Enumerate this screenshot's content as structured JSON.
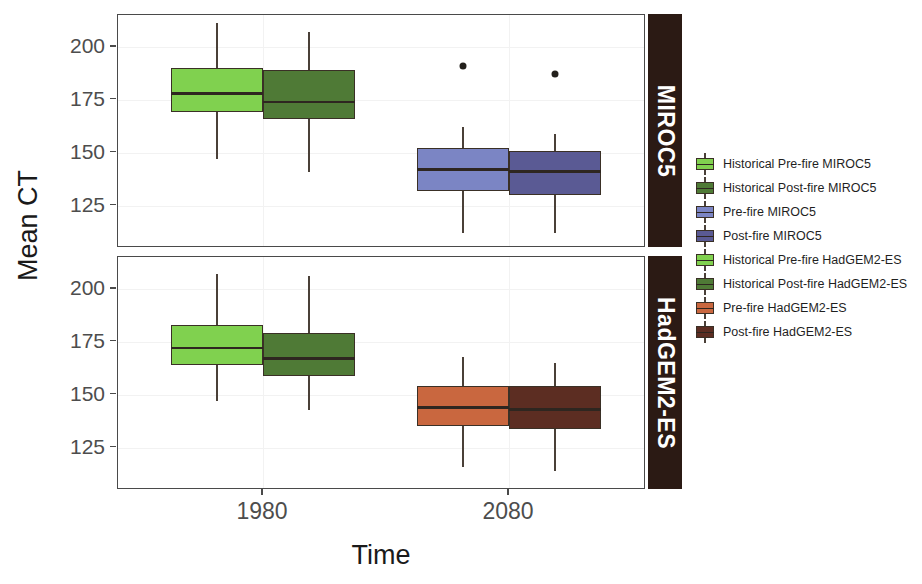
{
  "chart_data": {
    "type": "box",
    "title": "",
    "xlabel": "Time",
    "ylabel": "Mean CT",
    "grid": true,
    "legend_position": "right",
    "x_categories": [
      "1980",
      "2080"
    ],
    "y_ticks": [
      200,
      175,
      150,
      125
    ],
    "ylim": [
      105,
      215
    ],
    "facets": [
      {
        "name": "MIROC5",
        "strip_label": "MIROC5",
        "boxes": [
          {
            "label": "Historical Pre-fire MIROC5",
            "x_category": "1980",
            "color": "#80d14f",
            "whisker_high": 211,
            "q3": 190,
            "median": 178,
            "q1": 169,
            "whisker_low": 147,
            "outliers": []
          },
          {
            "label": "Historical Post-fire MIROC5",
            "x_category": "1980",
            "color": "#4f7a36",
            "whisker_high": 207,
            "q3": 189,
            "median": 174,
            "q1": 166,
            "whisker_low": 141,
            "outliers": []
          },
          {
            "label": "Pre-fire MIROC5",
            "x_category": "2080",
            "color": "#7b85c4",
            "whisker_high": 162,
            "q3": 152,
            "median": 142,
            "q1": 132,
            "whisker_low": 112,
            "outliers": [
              191
            ]
          },
          {
            "label": "Post-fire MIROC5",
            "x_category": "2080",
            "color": "#5a5a94",
            "whisker_high": 159,
            "q3": 151,
            "median": 141,
            "q1": 130,
            "whisker_low": 112,
            "outliers": [
              187
            ]
          }
        ]
      },
      {
        "name": "HadGEM2-ES",
        "strip_label": "HadGEM2-ES",
        "boxes": [
          {
            "label": "Historical Pre-fire HadGEM2-ES",
            "x_category": "1980",
            "color": "#80d14f",
            "whisker_high": 207,
            "q3": 183,
            "median": 172,
            "q1": 164,
            "whisker_low": 147,
            "outliers": []
          },
          {
            "label": "Historical Post-fire HadGEM2-ES",
            "x_category": "1980",
            "color": "#4f7a36",
            "whisker_high": 206,
            "q3": 179,
            "median": 167,
            "q1": 159,
            "whisker_low": 143,
            "outliers": []
          },
          {
            "label": "Pre-fire HadGEM2-ES",
            "x_category": "2080",
            "color": "#c9673f",
            "whisker_high": 168,
            "q3": 154,
            "median": 144,
            "q1": 135,
            "whisker_low": 116,
            "outliers": []
          },
          {
            "label": "Post-fire HadGEM2-ES",
            "x_category": "2080",
            "color": "#5c2d22",
            "whisker_high": 165,
            "q3": 154,
            "median": 143,
            "q1": 134,
            "whisker_low": 114,
            "outliers": []
          }
        ]
      }
    ],
    "legend": [
      {
        "label": "Historical Pre-fire MIROC5",
        "color": "#80d14f"
      },
      {
        "label": "Historical Post-fire MIROC5",
        "color": "#4f7a36"
      },
      {
        "label": "Pre-fire MIROC5",
        "color": "#7b85c4"
      },
      {
        "label": "Post-fire MIROC5",
        "color": "#5a5a94"
      },
      {
        "label": "Historical Pre-fire HadGEM2-ES",
        "color": "#80d14f"
      },
      {
        "label": "Historical Post-fire HadGEM2-ES",
        "color": "#4f7a36"
      },
      {
        "label": "Pre-fire HadGEM2-ES",
        "color": "#c9673f"
      },
      {
        "label": "Post-fire HadGEM2-ES",
        "color": "#5c2d22"
      }
    ]
  }
}
